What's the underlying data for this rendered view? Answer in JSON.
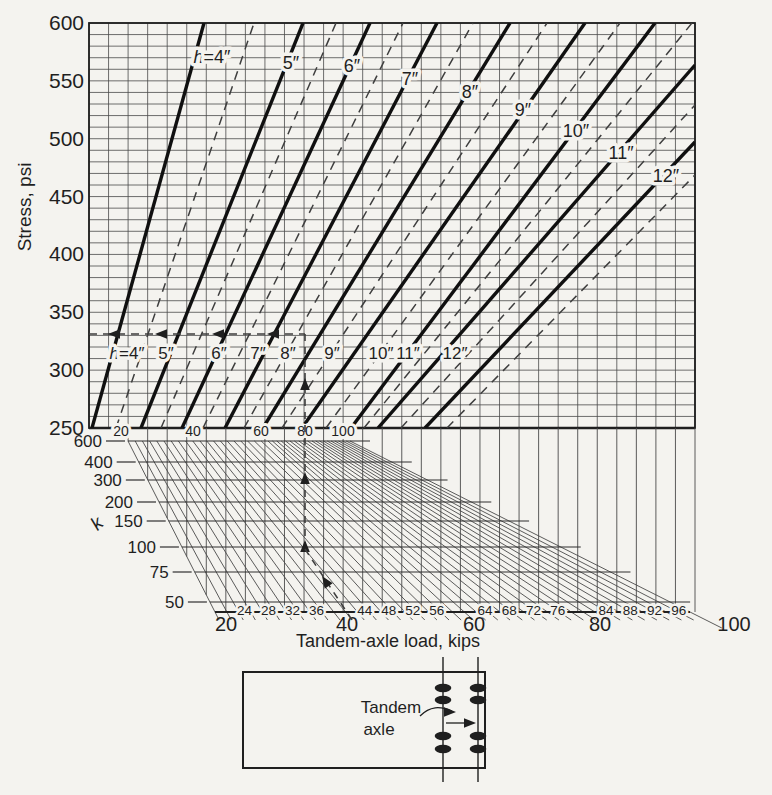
{
  "canvas": {
    "paper_color": "#f4f3ef",
    "ink_color": "#1f1f1f",
    "grid_color": "#4a4a4a",
    "dash_color": "#3e3e3e"
  },
  "chart_data": {
    "type": "line",
    "upper_chart": {
      "ylabel": "Stress, psi",
      "ylim": [
        250,
        600
      ],
      "yticks": [
        600,
        550,
        500,
        450,
        400,
        350,
        300,
        250
      ],
      "y_minor_step_psi": 10,
      "x_minor_divisions": 31,
      "grid": true,
      "h_values_in": [
        4,
        5,
        6,
        7,
        8,
        9,
        10,
        11,
        12
      ],
      "dashed_half_values_in": [
        4.5,
        5.5,
        6.5,
        7.5,
        8.5,
        9.5,
        10.5,
        11.5,
        12.5
      ],
      "bottom_label_row_y": 353,
      "h_curves": [
        {
          "label": "h=4″",
          "x_bottom": 92,
          "exit": [
            204,
            23
          ],
          "top_label_pos": [
            212,
            57
          ],
          "bottom_label_x": 127
        },
        {
          "label": "5″",
          "x_bottom": 141,
          "exit": [
            303,
            23
          ],
          "top_label_pos": [
            291,
            63
          ],
          "bottom_label_x": 166
        },
        {
          "label": "6″",
          "x_bottom": 182,
          "exit": [
            370,
            23
          ],
          "top_label_pos": [
            352,
            66
          ],
          "bottom_label_x": 219
        },
        {
          "label": "7″",
          "x_bottom": 225,
          "exit": [
            437,
            23
          ],
          "top_label_pos": [
            410,
            79
          ],
          "bottom_label_x": 258
        },
        {
          "label": "8″",
          "x_bottom": 263,
          "exit": [
            510,
            23
          ],
          "top_label_pos": [
            470,
            92
          ],
          "bottom_label_x": 288
        },
        {
          "label": "9″",
          "x_bottom": 302,
          "exit": [
            585,
            23
          ],
          "top_label_pos": [
            523,
            110
          ],
          "bottom_label_x": 332
        },
        {
          "label": "10″",
          "x_bottom": 351,
          "exit": [
            655,
            23
          ],
          "top_label_pos": [
            576,
            131
          ],
          "bottom_label_x": 381
        },
        {
          "label": "11″",
          "x_bottom": 378,
          "exit": [
            695,
            65
          ],
          "top_label_pos": [
            621,
            153
          ],
          "bottom_label_x": 408
        },
        {
          "label": "12″",
          "x_bottom": 425,
          "exit": [
            695,
            142
          ],
          "top_label_pos": [
            666,
            176
          ],
          "bottom_label_x": 455
        }
      ],
      "half_inch_dashed_curves": [
        {
          "x_bottom": 116,
          "exit": [
            254,
            23
          ]
        },
        {
          "x_bottom": 161,
          "exit": [
            336,
            23
          ]
        },
        {
          "x_bottom": 203,
          "exit": [
            403,
            23
          ]
        },
        {
          "x_bottom": 244,
          "exit": [
            473,
            23
          ]
        },
        {
          "x_bottom": 282,
          "exit": [
            547,
            23
          ]
        },
        {
          "x_bottom": 326,
          "exit": [
            620,
            23
          ]
        },
        {
          "x_bottom": 364,
          "exit": [
            692,
            23
          ]
        },
        {
          "x_bottom": 401,
          "exit": [
            695,
            105
          ]
        },
        {
          "x_bottom": 447,
          "exit": [
            695,
            175
          ]
        }
      ]
    },
    "projection_fan": {
      "k_axis_label": "k",
      "k_lines": [
        {
          "k": 600,
          "y": 441
        },
        {
          "k": 400,
          "y": 462
        },
        {
          "k": 300,
          "y": 480
        },
        {
          "k": 200,
          "y": 502
        },
        {
          "k": 150,
          "y": 521
        },
        {
          "k": 100,
          "y": 547
        },
        {
          "k": 75,
          "y": 572
        },
        {
          "k": 50,
          "y": 602
        }
      ],
      "top_scale": {
        "label_y": 436,
        "ticks": [
          {
            "kips": 20,
            "x": 128
          },
          {
            "kips": 40,
            "x": 200
          },
          {
            "kips": 60,
            "x": 268
          },
          {
            "kips": 80,
            "x": 312
          },
          {
            "kips": 100,
            "x": 350
          }
        ]
      },
      "diagonal_step_kips": 2,
      "bottom_scale": {
        "y": 612,
        "x_start": 215,
        "x_end": 690,
        "kips_start": 20,
        "kips_end": 100,
        "minor_labels": [
          24,
          28,
          32,
          36,
          44,
          48,
          52,
          56,
          64,
          68,
          72,
          76,
          84,
          88,
          92,
          96
        ],
        "major_labels": [
          20,
          40,
          60,
          80,
          100
        ],
        "major_label_x": [
          226,
          347,
          474,
          600,
          734
        ],
        "axis_title": "Tandem-axle load, kips"
      }
    },
    "example_trace": {
      "load_kips": 40,
      "k": 100,
      "stress_psi": 330,
      "stress_line_y": 334,
      "vertical_x": 305,
      "stress_arrow_xs": [
        108,
        155,
        212,
        267
      ],
      "vertical_arrow_ys": [
        378,
        472,
        540
      ]
    },
    "inset_diagram": {
      "label_line1": "Tandem",
      "label_line2": "axle"
    }
  }
}
